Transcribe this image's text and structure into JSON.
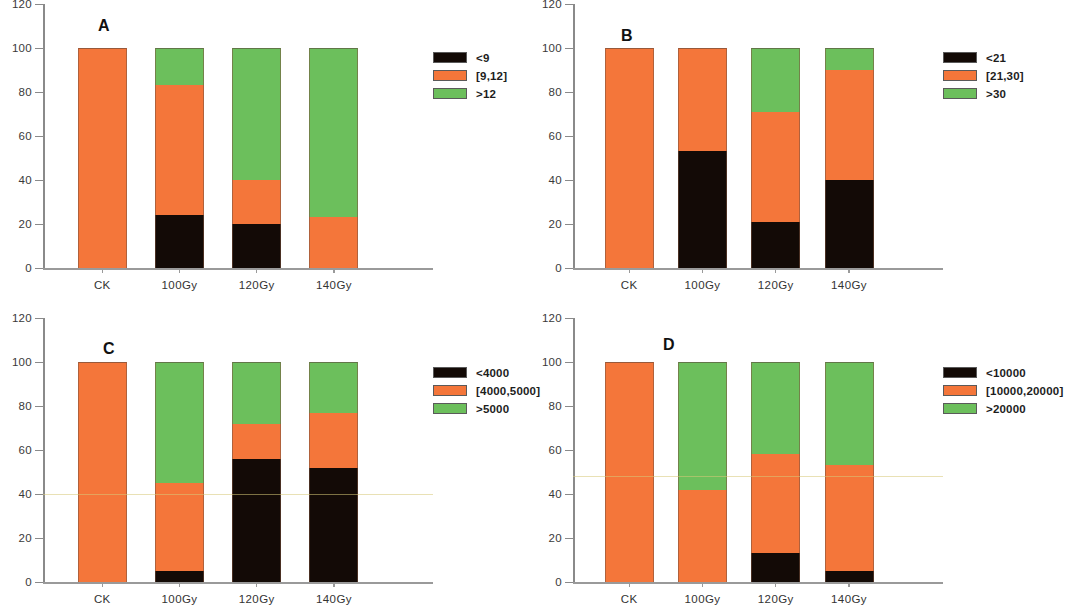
{
  "figure": {
    "categories": [
      "CK",
      "100Gy",
      "120Gy",
      "140Gy"
    ],
    "y_ticks": [
      "0",
      "20",
      "40",
      "60",
      "80",
      "100",
      "120"
    ],
    "ylim": [
      0,
      120
    ],
    "colors": {
      "black": "#130a06",
      "orange": "#f4763a",
      "green": "#6cbf5c"
    }
  },
  "chart_data": [
    {
      "type": "bar",
      "panel": "A",
      "title": "A",
      "stacked": true,
      "categories": [
        "CK",
        "100Gy",
        "120Gy",
        "140Gy"
      ],
      "series": [
        {
          "name": "<9",
          "color": "#130a06",
          "values": [
            0,
            24,
            20,
            0
          ]
        },
        {
          "name": "[9,12]",
          "color": "#f4763a",
          "values": [
            100,
            59,
            20,
            23
          ]
        },
        {
          "name": ">12",
          "color": "#6cbf5c",
          "values": [
            0,
            17,
            60,
            77
          ]
        }
      ],
      "legend": [
        "<9",
        "[9,12]",
        ">12"
      ],
      "xlabel": "",
      "ylabel": "",
      "ylim": [
        0,
        120
      ],
      "yticks": [
        0,
        20,
        40,
        60,
        80,
        100,
        120
      ],
      "legend_position": "right",
      "grid": false
    },
    {
      "type": "bar",
      "panel": "B",
      "title": "B",
      "stacked": true,
      "categories": [
        "CK",
        "100Gy",
        "120Gy",
        "140Gy"
      ],
      "series": [
        {
          "name": "<21",
          "color": "#130a06",
          "values": [
            0,
            53,
            21,
            40
          ]
        },
        {
          "name": "[21,30]",
          "color": "#f4763a",
          "values": [
            100,
            47,
            50,
            50
          ]
        },
        {
          "name": ">30",
          "color": "#6cbf5c",
          "values": [
            0,
            0,
            29,
            10
          ]
        }
      ],
      "legend": [
        "<21",
        "[21,30]",
        ">30"
      ],
      "xlabel": "",
      "ylabel": "",
      "ylim": [
        0,
        120
      ],
      "yticks": [
        0,
        20,
        40,
        60,
        80,
        100,
        120
      ],
      "legend_position": "right",
      "grid": false
    },
    {
      "type": "bar",
      "panel": "C",
      "title": "C",
      "stacked": true,
      "categories": [
        "CK",
        "100Gy",
        "120Gy",
        "140Gy"
      ],
      "series": [
        {
          "name": "<4000",
          "color": "#130a06",
          "values": [
            0,
            5,
            56,
            52
          ]
        },
        {
          "name": "[4000,5000]",
          "color": "#f4763a",
          "values": [
            100,
            40,
            16,
            25
          ]
        },
        {
          "name": ">5000",
          "color": "#6cbf5c",
          "values": [
            0,
            55,
            28,
            23
          ]
        }
      ],
      "legend": [
        "<4000",
        "[4000,5000]",
        ">5000"
      ],
      "xlabel": "",
      "ylabel": "",
      "ylim": [
        0,
        120
      ],
      "yticks": [
        0,
        20,
        40,
        60,
        80,
        100,
        120
      ],
      "legend_position": "right",
      "grid": false
    },
    {
      "type": "bar",
      "panel": "D",
      "title": "D",
      "stacked": true,
      "categories": [
        "CK",
        "100Gy",
        "120Gy",
        "140Gy"
      ],
      "series": [
        {
          "name": "<10000",
          "color": "#130a06",
          "values": [
            0,
            0,
            13,
            5
          ]
        },
        {
          "name": "[10000,20000]",
          "color": "#f4763a",
          "values": [
            100,
            42,
            45,
            48
          ]
        },
        {
          "name": ">20000",
          "color": "#6cbf5c",
          "values": [
            0,
            58,
            42,
            47
          ]
        }
      ],
      "legend": [
        "<10000",
        "[10000,20000]",
        ">20000"
      ],
      "xlabel": "",
      "ylabel": "",
      "ylim": [
        0,
        120
      ],
      "yticks": [
        0,
        20,
        40,
        60,
        80,
        100,
        120
      ],
      "legend_position": "right",
      "grid": false
    }
  ]
}
